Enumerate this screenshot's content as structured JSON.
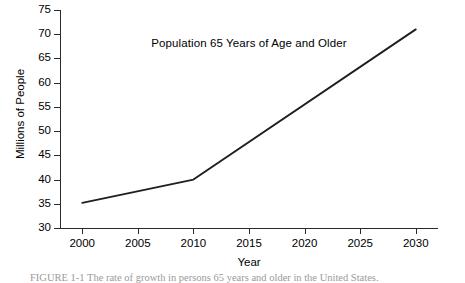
{
  "chart_data": {
    "type": "line",
    "title": "Population 65 Years of Age and Older",
    "xlabel": "Year",
    "ylabel": "Millions of People",
    "x": [
      2000,
      2010,
      2030
    ],
    "values": [
      35.2,
      40.0,
      71.0
    ],
    "series": [
      {
        "name": "Population 65 Years of Age and Older",
        "points": [
          {
            "x": 2000,
            "y": 35.2
          },
          {
            "x": 2010,
            "y": 40.0
          },
          {
            "x": 2030,
            "y": 71.0
          }
        ],
        "color": "#1f1f1f"
      }
    ],
    "xlim": [
      1998,
      2032
    ],
    "ylim": [
      30,
      75
    ],
    "x_ticks": [
      2000,
      2005,
      2010,
      2015,
      2020,
      2025,
      2030
    ],
    "x_tick_labels": [
      "2000",
      "2005",
      "2010",
      "2015",
      "2020",
      "2025",
      "2030"
    ],
    "y_ticks": [
      30,
      35,
      40,
      45,
      50,
      55,
      60,
      65,
      70,
      75
    ],
    "y_tick_labels": [
      "30",
      "35",
      "40",
      "45",
      "50",
      "55",
      "60",
      "65",
      "70",
      "75"
    ],
    "grid": false,
    "legend": false,
    "legend_position": "none",
    "annotations": []
  },
  "caption": {
    "text": "FIGURE 1-1   The rate of growth in persons 65 years and older in the United States."
  }
}
